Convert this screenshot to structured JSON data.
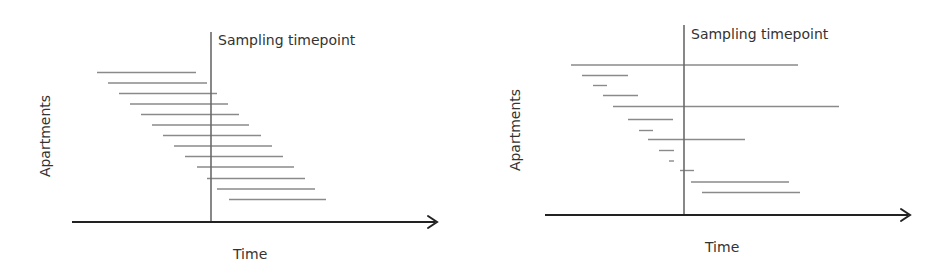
{
  "figure": {
    "width": 950,
    "height": 268,
    "colors": {
      "interval_line": "#8a8a8a",
      "timepoint_line": "#6a6a6a",
      "axis": "#222222",
      "text": "#333333",
      "background": "#ffffff"
    }
  },
  "panels": [
    {
      "id": "left",
      "title": "Sampling timepoint",
      "x_label": "Time",
      "y_label": "Apartments",
      "title_pos": {
        "x": 218,
        "y": 33
      },
      "x_label_pos": {
        "x": 233,
        "y": 247
      },
      "y_label_pos": {
        "x": 45,
        "y": 136
      },
      "timepoint": {
        "x": 211,
        "y1": 32,
        "y2": 222
      },
      "axis": {
        "x1": 72,
        "x2": 437,
        "y": 222
      },
      "intervals": [
        {
          "x1": 97,
          "x2": 196,
          "y": 72.5
        },
        {
          "x1": 108,
          "x2": 207,
          "y": 83
        },
        {
          "x1": 119,
          "x2": 217,
          "y": 93.5
        },
        {
          "x1": 130,
          "x2": 228,
          "y": 104
        },
        {
          "x1": 141,
          "x2": 239,
          "y": 114.5
        },
        {
          "x1": 152,
          "x2": 249,
          "y": 125
        },
        {
          "x1": 163,
          "x2": 261,
          "y": 135.5
        },
        {
          "x1": 174,
          "x2": 272,
          "y": 146
        },
        {
          "x1": 185,
          "x2": 283,
          "y": 156.5
        },
        {
          "x1": 197,
          "x2": 294,
          "y": 167
        },
        {
          "x1": 207,
          "x2": 305,
          "y": 178.5
        },
        {
          "x1": 217,
          "x2": 315,
          "y": 189
        },
        {
          "x1": 229,
          "x2": 326,
          "y": 199.5
        }
      ]
    },
    {
      "id": "right",
      "title": "Sampling timepoint",
      "x_label": "Time",
      "y_label": "Apartments",
      "title_pos": {
        "x": 691,
        "y": 27
      },
      "x_label_pos": {
        "x": 705,
        "y": 240
      },
      "y_label_pos": {
        "x": 515,
        "y": 130
      },
      "timepoint": {
        "x": 684,
        "y1": 25,
        "y2": 215
      },
      "axis": {
        "x1": 545,
        "x2": 910,
        "y": 215
      },
      "intervals": [
        {
          "x1": 571,
          "x2": 798,
          "y": 65
        },
        {
          "x1": 582,
          "x2": 628,
          "y": 75.5
        },
        {
          "x1": 593,
          "x2": 607,
          "y": 85.5
        },
        {
          "x1": 603,
          "x2": 638,
          "y": 95.5
        },
        {
          "x1": 613,
          "x2": 839,
          "y": 106.5
        },
        {
          "x1": 628,
          "x2": 673,
          "y": 119.5
        },
        {
          "x1": 639,
          "x2": 653,
          "y": 130.5
        },
        {
          "x1": 648,
          "x2": 745,
          "y": 139.5
        },
        {
          "x1": 659,
          "x2": 674,
          "y": 150.5
        },
        {
          "x1": 669,
          "x2": 674,
          "y": 161
        },
        {
          "x1": 680,
          "x2": 694,
          "y": 170.5
        },
        {
          "x1": 691,
          "x2": 789,
          "y": 182
        },
        {
          "x1": 702,
          "x2": 800,
          "y": 192.5
        }
      ]
    }
  ]
}
